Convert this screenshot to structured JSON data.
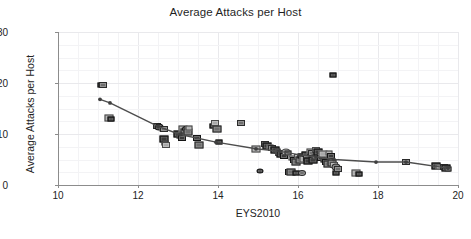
{
  "chart_data": {
    "type": "scatter",
    "title": "Average Attacks per Host",
    "xlabel": "EYS2010",
    "ylabel": "Average Attacks per Host",
    "xlim": [
      10,
      20
    ],
    "ylim": [
      0,
      30
    ],
    "xticks": [
      10,
      12,
      14,
      16,
      18,
      20
    ],
    "yticks": [
      0,
      10,
      20,
      30
    ],
    "xtick_labels": [
      "10",
      "12",
      "14",
      "16",
      "18",
      "20"
    ],
    "ytick_labels": [
      "0",
      "10",
      "20",
      "30"
    ],
    "x_minor_step": 0.5,
    "y_minor_step": 2.5,
    "grid": true,
    "legend": null,
    "marker_style": "small grayscale square image thumbnails",
    "series": [
      {
        "name": "Countries",
        "points": [
          [
            11.08,
            19.7
          ],
          [
            11.12,
            19.6
          ],
          [
            11.28,
            13.1
          ],
          [
            11.33,
            12.9
          ],
          [
            12.47,
            11.6
          ],
          [
            12.52,
            11.4
          ],
          [
            12.62,
            11.0
          ],
          [
            12.66,
            10.9
          ],
          [
            12.64,
            9.0
          ],
          [
            12.68,
            8.3
          ],
          [
            12.7,
            7.9
          ],
          [
            13.0,
            10.0
          ],
          [
            13.06,
            9.6
          ],
          [
            13.1,
            9.3
          ],
          [
            13.13,
            11.0
          ],
          [
            13.16,
            10.6
          ],
          [
            13.2,
            10.9
          ],
          [
            13.24,
            10.3
          ],
          [
            13.28,
            11.1
          ],
          [
            13.48,
            9.2
          ],
          [
            13.52,
            7.8
          ],
          [
            13.88,
            11.5
          ],
          [
            13.93,
            12.2
          ],
          [
            13.97,
            11.0
          ],
          [
            14.02,
            8.4
          ],
          [
            14.58,
            12.2
          ],
          [
            14.96,
            7.1
          ],
          [
            15.06,
            2.8
          ],
          [
            15.18,
            8.0
          ],
          [
            15.22,
            7.6
          ],
          [
            15.3,
            7.5
          ],
          [
            15.36,
            7.2
          ],
          [
            15.42,
            6.9
          ],
          [
            15.48,
            6.6
          ],
          [
            15.52,
            6.2
          ],
          [
            15.58,
            6.0
          ],
          [
            15.62,
            5.8
          ],
          [
            15.66,
            5.6
          ],
          [
            15.7,
            6.5
          ],
          [
            15.74,
            6.3
          ],
          [
            15.78,
            2.6
          ],
          [
            15.82,
            2.5
          ],
          [
            15.86,
            5.2
          ],
          [
            15.9,
            5.0
          ],
          [
            15.94,
            4.6
          ],
          [
            15.96,
            2.4
          ],
          [
            16.0,
            5.4
          ],
          [
            16.04,
            4.9
          ],
          [
            16.08,
            5.6
          ],
          [
            16.1,
            2.3
          ],
          [
            16.14,
            5.1
          ],
          [
            16.18,
            6.0
          ],
          [
            16.22,
            5.3
          ],
          [
            16.26,
            4.8
          ],
          [
            16.3,
            6.6
          ],
          [
            16.34,
            6.2
          ],
          [
            16.38,
            5.0
          ],
          [
            16.42,
            5.5
          ],
          [
            16.46,
            6.9
          ],
          [
            16.5,
            6.4
          ],
          [
            16.54,
            5.8
          ],
          [
            16.58,
            5.2
          ],
          [
            16.62,
            6.0
          ],
          [
            16.66,
            4.9
          ],
          [
            16.7,
            4.5
          ],
          [
            16.74,
            4.2
          ],
          [
            16.78,
            6.3
          ],
          [
            16.82,
            5.7
          ],
          [
            16.86,
            4.4
          ],
          [
            16.88,
            21.5
          ],
          [
            16.9,
            4.0
          ],
          [
            16.94,
            3.6
          ],
          [
            16.96,
            2.4
          ],
          [
            17.0,
            3.2
          ],
          [
            17.46,
            2.4
          ],
          [
            17.52,
            2.2
          ],
          [
            18.7,
            4.5
          ],
          [
            19.46,
            3.8
          ],
          [
            19.52,
            3.6
          ],
          [
            19.64,
            3.5
          ],
          [
            19.7,
            3.3
          ],
          [
            19.76,
            3.1
          ]
        ]
      }
    ],
    "trend_line": {
      "name": "fitted trend",
      "points": [
        [
          11.05,
          16.8
        ],
        [
          11.3,
          16.1
        ],
        [
          12.5,
          11.5
        ],
        [
          13.05,
          9.9
        ],
        [
          13.95,
          8.4
        ],
        [
          14.95,
          7.1
        ],
        [
          15.55,
          6.6
        ],
        [
          16.05,
          5.9
        ],
        [
          16.45,
          5.5
        ],
        [
          16.9,
          5.0
        ],
        [
          17.95,
          4.5
        ],
        [
          18.7,
          4.5
        ],
        [
          19.75,
          3.3
        ]
      ],
      "color": "#4d4d4d"
    },
    "colors": {
      "grid_major": "#e9e9ec",
      "grid_minor": "#f3f3f5",
      "axis": "#8c8c8c",
      "text": "#232323",
      "marker_dark": "#3a3a3a",
      "marker_mid": "#6f6f6f",
      "marker_light": "#a9a9a9"
    }
  }
}
